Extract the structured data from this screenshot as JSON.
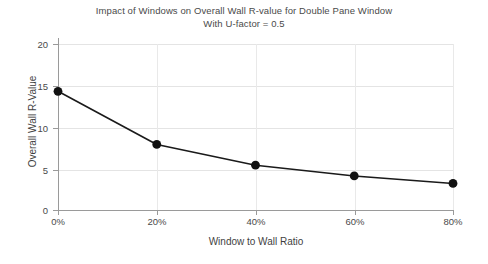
{
  "chart_data": {
    "type": "line",
    "title": "Impact of Windows on Overall Wall R-value for Double Pane Window",
    "subtitle": "With U-factor = 0.5",
    "xlabel": "Window to Wall Ratio",
    "ylabel": "Overall Wall R-Value",
    "categories": [
      "0%",
      "20%",
      "40%",
      "60%",
      "80%"
    ],
    "x": [
      0,
      20,
      40,
      60,
      80
    ],
    "values": [
      14.3,
      7.9,
      5.4,
      4.1,
      3.2
    ],
    "series": [
      {
        "name": "Overall Wall R-Value",
        "values": [
          14.3,
          7.9,
          5.4,
          4.1,
          3.2
        ],
        "color": "#1a1a1a",
        "marker": "circle"
      }
    ],
    "xlim": [
      0,
      80
    ],
    "ylim": [
      0,
      20
    ],
    "yticks": [
      0,
      5,
      10,
      15,
      20
    ],
    "ytick_labels": [
      "0",
      "5",
      "10",
      "15",
      "20"
    ],
    "xticks": [
      0,
      20,
      40,
      60,
      80
    ],
    "xtick_labels": [
      "0%",
      "20%",
      "40%",
      "60%",
      "80%"
    ],
    "grid": true,
    "grid_color": "#e4e4e4",
    "legend": false,
    "legend_position": "none",
    "background": "#ffffff",
    "axis_color": "#9a9a9a",
    "line_color": "#1a1a1a",
    "marker_color": "#111111"
  }
}
